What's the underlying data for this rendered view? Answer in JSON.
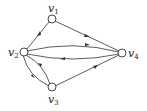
{
  "diagram": {
    "type": "directed-graph",
    "nodes": [
      {
        "id": "v1",
        "label": "v",
        "sub": "1",
        "x": 52,
        "y": 19
      },
      {
        "id": "v2",
        "label": "v",
        "sub": "2",
        "x": 24,
        "y": 52
      },
      {
        "id": "v3",
        "label": "v",
        "sub": "3",
        "x": 52,
        "y": 87
      },
      {
        "id": "v4",
        "label": "v",
        "sub": "4",
        "x": 122,
        "y": 53
      }
    ],
    "edges": [
      {
        "from": "v2",
        "to": "v1"
      },
      {
        "from": "v1",
        "to": "v4"
      },
      {
        "from": "v2",
        "to": "v4",
        "curve": "upper"
      },
      {
        "from": "v4",
        "to": "v2",
        "curve": "lower"
      },
      {
        "from": "v3",
        "to": "v4"
      },
      {
        "from": "v2",
        "to": "v3",
        "curve": "outer"
      },
      {
        "from": "v3",
        "to": "v2",
        "curve": "inner"
      }
    ]
  }
}
